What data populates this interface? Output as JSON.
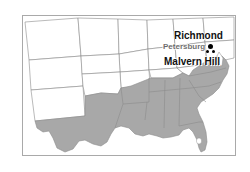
{
  "figure": {
    "type": "reference-map",
    "region": "United States — Southeast / Confederate states",
    "background_color": "#ffffff",
    "frame_color": "#a9a9a9"
  },
  "map": {
    "shaded_region_label": "Confederate States",
    "shaded_fill_color": "#a8a8a8",
    "unshaded_fill_color": "#ffffff",
    "state_border_color": "#8c8c8c",
    "coastline_color": "#8c8c8c",
    "inland_water_color": "#ffffff"
  },
  "labels": [
    {
      "id": "richmond",
      "text": "Richmond",
      "color": "#111111",
      "emphasis": "bold"
    },
    {
      "id": "petersburg",
      "text": "Petersburg",
      "color": "#5a5a5a",
      "emphasis": "bold-faded"
    },
    {
      "id": "malvern_hill",
      "text": "Malvern Hill",
      "color": "#111111",
      "emphasis": "bold"
    }
  ],
  "markers": {
    "marker_color": "#000000",
    "richmond_marker": "site-dot",
    "petersburg_marker": "site-dot",
    "malvern_hill_marker": "site-dot"
  }
}
